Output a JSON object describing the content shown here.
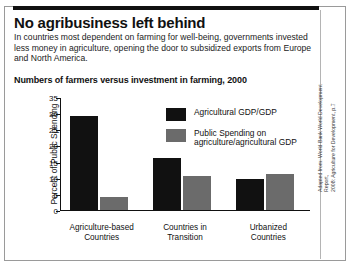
{
  "headline": "No agribusiness left behind",
  "deck": "In countries most dependent on farming for well-being, governments invested less money in agriculture, opening the door to subsidized exports from Europe and North America.",
  "source": "Adapted from: World Bank World Development Report,\n2008: Agriculture for Development, p.7",
  "legend": [
    {
      "label": "Agricultural GDP/GDP",
      "color": "#111111"
    },
    {
      "label": "Public Spending on\nagriculture/agricultural GDP",
      "color": "#6b6b6b"
    }
  ],
  "chart_data": {
    "type": "bar",
    "title": "Numbers of farmers versus investment in farming, 2000",
    "xlabel": "",
    "ylabel": "Percent of Public Spending",
    "ylim": [
      0,
      35
    ],
    "yticks": [
      0,
      5,
      10,
      15,
      20,
      25,
      30,
      35
    ],
    "grid": false,
    "legend_position": "top-right",
    "categories": [
      "Agriculture-based\nCountries",
      "Countries in\nTransition",
      "Urbanized\nCountries"
    ],
    "series": [
      {
        "name": "Agricultural GDP/GDP",
        "color": "#111111",
        "values": [
          29,
          16,
          9.7
        ]
      },
      {
        "name": "Public Spending on agriculture/agricultural GDP",
        "color": "#6b6b6b",
        "values": [
          4,
          10.5,
          11.3
        ]
      }
    ]
  }
}
